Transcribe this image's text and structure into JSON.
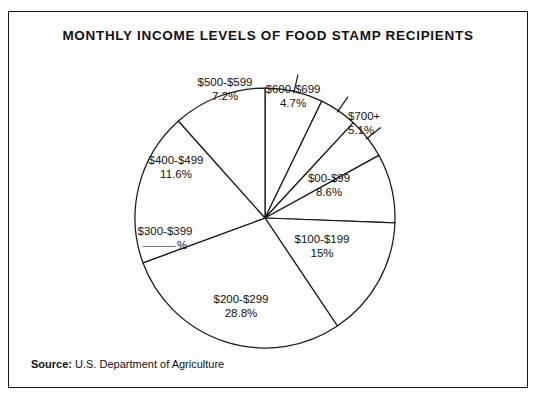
{
  "figure": {
    "title": "MONTHLY INCOME LEVELS OF FOOD STAMP RECIPIENTS",
    "source_label": "Source:",
    "source_text": "U.S. Department of Agriculture",
    "line_color": "#1a1a1a",
    "slice_fill": "#ffffff",
    "background": "#fefefe"
  },
  "chart_data": {
    "type": "pie",
    "title": "MONTHLY INCOME LEVELS OF FOOD STAMP RECIPIENTS",
    "xlabel": "",
    "ylabel": "",
    "legend_position": "none",
    "grid": false,
    "note": "Percentage for $300-$399 is left blank (fill-in-the-blank worksheet).",
    "categories": [
      "$500-$599",
      "$600-$699",
      "$700+",
      "$00-$99",
      "$100-$199",
      "$200-$299",
      "$300-$399",
      "$400-$499"
    ],
    "values": [
      7.2,
      4.7,
      5.1,
      8.6,
      15.0,
      28.8,
      19.0,
      11.6
    ],
    "value_labels": [
      "7.2%",
      "4.7%",
      "5.1%",
      "8.6%",
      "15%",
      "28.8%",
      "",
      "11.6%"
    ],
    "slices": [
      {
        "label": "$500-$599",
        "percent_text": "7.2%",
        "value": 7.2,
        "start_angle": 0,
        "end_angle": 25.92,
        "label_x": 216,
        "label_y": 63,
        "pct_x": 229,
        "pct_y": 100,
        "align": "center",
        "has_leader": true
      },
      {
        "label": "$600-$699",
        "percent_text": "4.7%",
        "value": 4.7,
        "start_angle": 25.92,
        "end_angle": 42.84,
        "label_x": 284,
        "label_y": 70,
        "pct_x": 277,
        "pct_y": 111,
        "align": "center",
        "has_leader": true
      },
      {
        "label": "$700+",
        "percent_text": "5.1%",
        "value": 5.1,
        "start_angle": 42.84,
        "end_angle": 61.2,
        "label_x": 339,
        "label_y": 97,
        "pct_x": 303,
        "pct_y": 133,
        "align": "left",
        "has_leader": true
      },
      {
        "label": "$00-$99",
        "percent_text": "8.6%",
        "value": 8.6,
        "start_angle": 61.2,
        "end_angle": 92.16,
        "label_x": 320,
        "label_y": 159,
        "pct_x": 328,
        "pct_y": 172,
        "align": "center",
        "has_leader": false
      },
      {
        "label": "$100-$199",
        "percent_text": "15%",
        "value": 15.0,
        "start_angle": 92.16,
        "end_angle": 146.16,
        "label_x": 313,
        "label_y": 220,
        "pct_x": 336,
        "pct_y": 234,
        "align": "center",
        "has_leader": false
      },
      {
        "label": "$200-$299",
        "percent_text": "28.8%",
        "value": 28.8,
        "start_angle": 146.16,
        "end_angle": 249.84,
        "label_x": 232,
        "label_y": 280,
        "pct_x": 245,
        "pct_y": 294,
        "align": "center",
        "has_leader": false
      },
      {
        "label": "$300-$399",
        "percent_text": "",
        "value": 19.0,
        "start_angle": 249.84,
        "end_angle": 318.24,
        "label_x": 156,
        "label_y": 212,
        "pct_x": 178,
        "pct_y": 226,
        "align": "center",
        "has_leader": false,
        "blank": true
      },
      {
        "label": "$400-$499",
        "percent_text": "11.6%",
        "value": 11.6,
        "start_angle": 318.24,
        "end_angle": 360,
        "label_x": 167,
        "label_y": 141,
        "pct_x": 185,
        "pct_y": 155,
        "align": "center",
        "has_leader": false
      }
    ],
    "geometry": {
      "center_x": 256,
      "center_y": 206,
      "radius": 130
    }
  }
}
